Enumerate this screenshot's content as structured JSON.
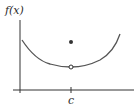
{
  "diagram": {
    "y_axis_label": "f(x)",
    "x_tick_label": "c",
    "colors": {
      "axis": "#333333",
      "curve": "#555555",
      "point": "#333333"
    },
    "elements": {
      "curve": "U-shaped curve with minimum near x = c",
      "open_circle": "hole on curve at x = c",
      "filled_point": "f(c), located above the hole"
    }
  }
}
